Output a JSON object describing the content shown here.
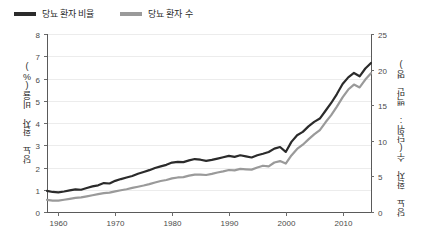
{
  "legend": {
    "items": [
      {
        "label": "당뇨 환자 비율",
        "color": "#2b2b2b"
      },
      {
        "label": "당뇨 환자 수",
        "color": "#9a9a9a"
      }
    ]
  },
  "axes": {
    "y_left_title": "당뇨 환자 비율(%)",
    "y_right_title": "당뇨 환자 수(단위: 백만 명)",
    "y_left_ticks": [
      "0",
      "1",
      "2",
      "3",
      "4",
      "5",
      "6",
      "7",
      "8"
    ],
    "y_right_ticks": [
      "0",
      "5",
      "10",
      "15",
      "20",
      "25"
    ],
    "x_ticks": [
      "1960",
      "1970",
      "1980",
      "1990",
      "2000",
      "2010"
    ]
  },
  "chart_data": {
    "type": "line",
    "title": "",
    "xlabel": "",
    "ylabel": "당뇨 환자 비율(%)",
    "ylabel_right": "당뇨 환자 수(단위: 백만 명)",
    "xlim": [
      1958,
      2015
    ],
    "ylim": [
      0,
      8
    ],
    "ylim_right": [
      0,
      25
    ],
    "grid": true,
    "legend_position": "top-left",
    "x": [
      1958,
      1959,
      1960,
      1961,
      1962,
      1963,
      1964,
      1965,
      1966,
      1967,
      1968,
      1969,
      1970,
      1971,
      1972,
      1973,
      1974,
      1975,
      1976,
      1977,
      1978,
      1979,
      1980,
      1981,
      1982,
      1983,
      1984,
      1985,
      1986,
      1987,
      1988,
      1989,
      1990,
      1991,
      1992,
      1993,
      1994,
      1995,
      1996,
      1997,
      1998,
      1999,
      2000,
      2001,
      2002,
      2003,
      2004,
      2005,
      2006,
      2007,
      2008,
      2009,
      2010,
      2011,
      2012,
      2013,
      2014,
      2015
    ],
    "series": [
      {
        "name": "당뇨 환자 비율",
        "axis": "left",
        "color": "#2b2b2b",
        "width": 2.2,
        "values": [
          0.95,
          0.9,
          0.88,
          0.92,
          0.97,
          1.02,
          1.0,
          1.08,
          1.15,
          1.2,
          1.3,
          1.28,
          1.4,
          1.48,
          1.55,
          1.62,
          1.72,
          1.8,
          1.88,
          1.98,
          2.05,
          2.12,
          2.22,
          2.25,
          2.24,
          2.32,
          2.38,
          2.35,
          2.3,
          2.34,
          2.4,
          2.46,
          2.52,
          2.48,
          2.55,
          2.5,
          2.45,
          2.55,
          2.62,
          2.7,
          2.85,
          2.92,
          2.7,
          3.15,
          3.45,
          3.6,
          3.85,
          4.05,
          4.2,
          4.55,
          4.9,
          5.3,
          5.75,
          6.05,
          6.25,
          6.1,
          6.45,
          6.7
        ],
        "values_tail": [
          6.55,
          6.8,
          7.05,
          6.95,
          7.25,
          7.45
        ]
      },
      {
        "name": "당뇨 환자 수",
        "axis": "right",
        "color": "#9a9a9a",
        "width": 2.2,
        "values": [
          1.7,
          1.6,
          1.6,
          1.72,
          1.85,
          1.98,
          2.05,
          2.2,
          2.35,
          2.5,
          2.65,
          2.72,
          2.9,
          3.05,
          3.2,
          3.38,
          3.55,
          3.72,
          3.92,
          4.15,
          4.35,
          4.5,
          4.72,
          4.85,
          4.9,
          5.1,
          5.25,
          5.25,
          5.2,
          5.35,
          5.55,
          5.7,
          5.9,
          5.85,
          6.05,
          6.0,
          5.95,
          6.25,
          6.5,
          6.4,
          6.95,
          7.15,
          6.8,
          7.95,
          8.85,
          9.45,
          10.2,
          10.9,
          11.5,
          12.6,
          13.6,
          14.8,
          16.1,
          17.2,
          17.9,
          17.5,
          18.6,
          19.5
        ],
        "values_tail": [
          19.2,
          20.0,
          20.9,
          20.6,
          21.6,
          22.3
        ]
      }
    ]
  }
}
